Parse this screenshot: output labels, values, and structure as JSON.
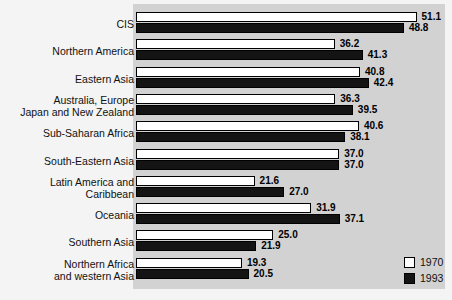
{
  "chart_data": {
    "type": "bar",
    "orientation": "horizontal",
    "title": "",
    "subtitle": "",
    "xlabel": "",
    "ylabel": "",
    "xlim": [
      0,
      55
    ],
    "grid": false,
    "legend_position": "bottom-right",
    "categories": [
      "CIS",
      "Northern America",
      "Eastern Asia",
      "Australia, Europe\nJapan and New Zealand",
      "Sub-Saharan Africa",
      "South-Eastern Asia",
      "Latin America and\nCaribbean",
      "Oceania",
      "Southern Asia",
      "Northern Africa\nand western Asia"
    ],
    "series": [
      {
        "name": "1970",
        "color": "#ffffff",
        "values": [
          51.1,
          36.2,
          40.8,
          36.3,
          40.6,
          37.0,
          21.6,
          31.9,
          25.0,
          19.3
        ],
        "labels": [
          "51.1",
          "36.2",
          "40.8",
          "36.3",
          "40.6",
          "37.0",
          "21.6",
          "31.9",
          "25.0",
          "19.3"
        ]
      },
      {
        "name": "1993",
        "color": "#141414",
        "values": [
          48.8,
          41.3,
          42.4,
          39.5,
          38.1,
          37.0,
          27.0,
          37.1,
          21.9,
          20.5
        ],
        "labels": [
          "48.8",
          "41.3",
          "42.4",
          "39.5",
          "38.1",
          "37.0",
          "27.0",
          "37.1",
          "21.9",
          "20.5"
        ]
      }
    ]
  },
  "legend": {
    "items": [
      {
        "label": "1970",
        "swatch": "white-square-icon"
      },
      {
        "label": "1993",
        "swatch": "black-square-icon"
      }
    ]
  },
  "colors": {
    "panel_background": "#d2d2d2",
    "page_background": "#f4f4f4",
    "bar_1970": "#ffffff",
    "bar_1993": "#141414",
    "bar_outline": "#000000",
    "text": "#111111"
  }
}
